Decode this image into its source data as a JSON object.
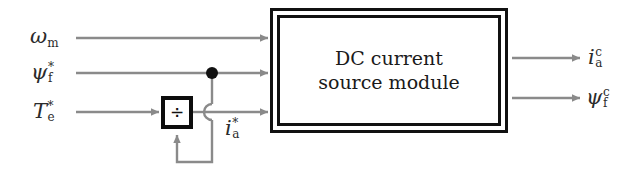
{
  "diagram": {
    "colors": {
      "line": "#8a8a8a",
      "box_border": "#111111",
      "text": "#2b2b2b",
      "background": "#ffffff"
    },
    "module": {
      "label_line1": "DC current",
      "label_line2": "source module"
    },
    "divider_block": {
      "symbol": "÷",
      "name": "division-block"
    },
    "inputs": [
      {
        "base": "ω",
        "sup": "",
        "sub": "m",
        "name": "omega-m"
      },
      {
        "base": "ψ",
        "sup": "*",
        "sub": "f",
        "name": "psi-f-ref"
      },
      {
        "base": "T",
        "sup": "*",
        "sub": "e",
        "name": "torque-ref"
      }
    ],
    "internal": [
      {
        "base": "i",
        "sup": "*",
        "sub": "a",
        "name": "ia-ref"
      }
    ],
    "outputs": [
      {
        "base": "i",
        "sup": "c",
        "sub": "a",
        "name": "ia-measured"
      },
      {
        "base": "ψ",
        "sup": "c",
        "sub": "f",
        "name": "psi-f-measured"
      }
    ]
  }
}
